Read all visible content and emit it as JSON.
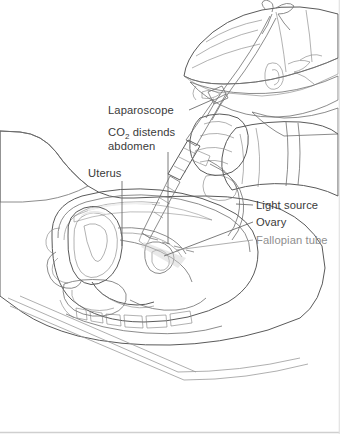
{
  "figure": {
    "style": "grayscale line drawing"
  },
  "labels": [
    {
      "id": "laparoscope",
      "text": "Laparoscope",
      "side": "left"
    },
    {
      "id": "co2-line1",
      "text": "CO",
      "sub": "2",
      "text_after": " distends",
      "side": "left"
    },
    {
      "id": "co2-line2",
      "text": "abdomen",
      "side": "left"
    },
    {
      "id": "uterus",
      "text": "Uterus",
      "side": "left"
    },
    {
      "id": "light-source",
      "text": "Light source",
      "side": "right"
    },
    {
      "id": "ovary",
      "text": "Ovary",
      "side": "right"
    },
    {
      "id": "fallopian-tube",
      "text": "Fallopian tube",
      "side": "right"
    }
  ],
  "colors": {
    "background": "#ffffff",
    "ink": "#3a3a3a",
    "ink_faded": "#8e8e8e",
    "leader": "#6d6d6d",
    "drape_fill": "#b9b9b9",
    "body_fill": "#a9a9a9",
    "cap_fill": "#f2f2f2",
    "mask_fill": "#5d5d5d",
    "glove_fill": "#e6e6e6",
    "instrument_fill": "#d5d5d5",
    "uterus_dark": "#6f6f6f",
    "uterus_mid": "#9a9a9a",
    "cavity_light": "#ededed",
    "bone_white": "#fbfbfb",
    "border": "#cfcfcf"
  }
}
